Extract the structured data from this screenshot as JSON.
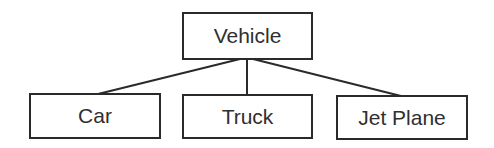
{
  "diagram": {
    "type": "tree",
    "root": {
      "id": "vehicle",
      "label": "Vehicle"
    },
    "children": [
      {
        "id": "car",
        "label": "Car"
      },
      {
        "id": "truck",
        "label": "Truck"
      },
      {
        "id": "jet-plane",
        "label": "Jet Plane"
      }
    ],
    "edges": [
      {
        "from": "vehicle",
        "to": "car"
      },
      {
        "from": "vehicle",
        "to": "truck"
      },
      {
        "from": "vehicle",
        "to": "jet-plane"
      }
    ],
    "colors": {
      "stroke": "#2a2a2a",
      "text": "#2f2f2f",
      "background": "#ffffff"
    }
  }
}
